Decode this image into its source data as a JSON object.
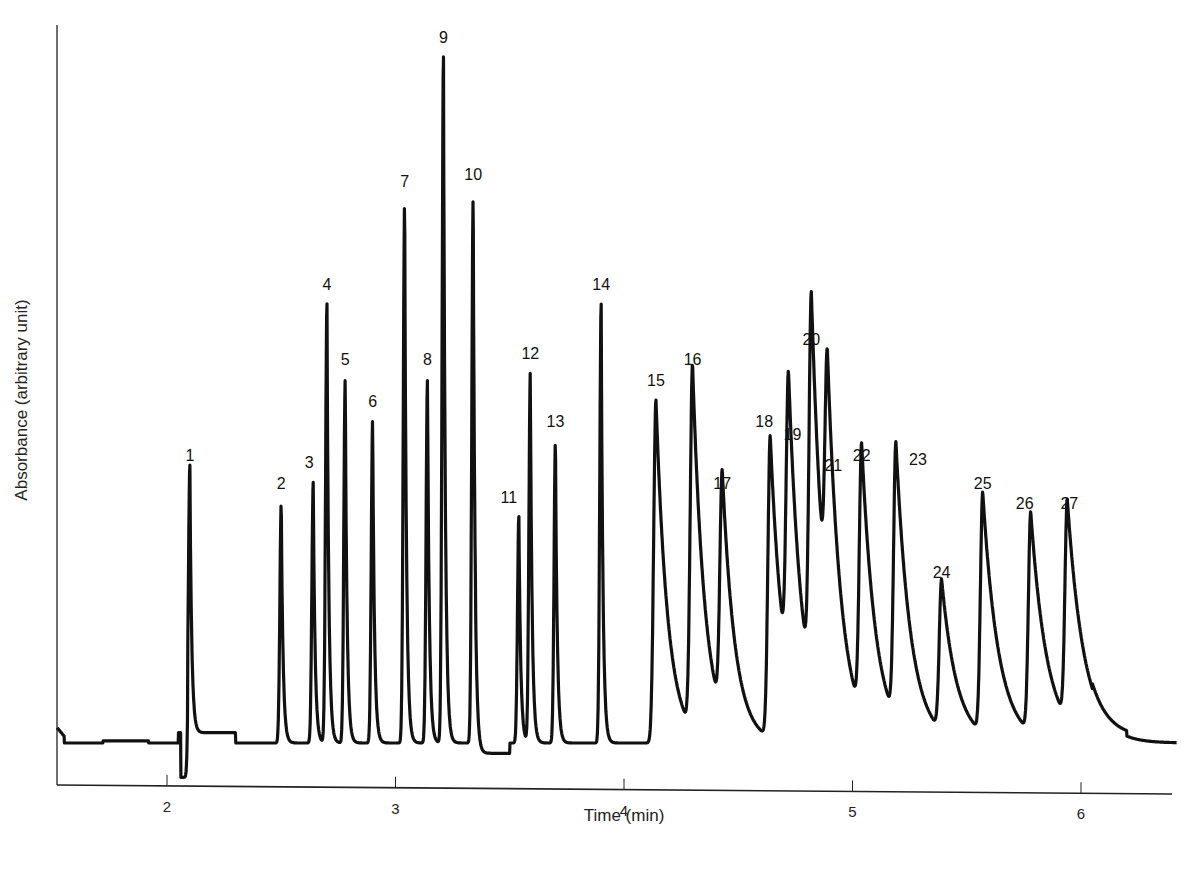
{
  "chart_data": {
    "type": "line",
    "title": "",
    "xlabel": "Time (min)",
    "ylabel": "Absorbance (arbitrary unit)",
    "xlim": [
      1.5,
      6.4
    ],
    "ylim": [
      0,
      100
    ],
    "xticks": [
      2,
      3,
      4,
      5,
      6
    ],
    "yticks": [],
    "grid": false,
    "legend": null,
    "peaks": [
      {
        "label": "1",
        "time": 2.1,
        "height": 39
      },
      {
        "label": "2",
        "time": 2.5,
        "height": 35
      },
      {
        "label": "3",
        "time": 2.64,
        "height": 38
      },
      {
        "label": "4",
        "time": 2.7,
        "height": 64
      },
      {
        "label": "5",
        "time": 2.78,
        "height": 53
      },
      {
        "label": "6",
        "time": 2.9,
        "height": 47
      },
      {
        "label": "7",
        "time": 3.04,
        "height": 79
      },
      {
        "label": "8",
        "time": 3.14,
        "height": 53
      },
      {
        "label": "9",
        "time": 3.21,
        "height": 100
      },
      {
        "label": "10",
        "time": 3.34,
        "height": 80
      },
      {
        "label": "11",
        "time": 3.54,
        "height": 33
      },
      {
        "label": "12",
        "time": 3.59,
        "height": 54
      },
      {
        "label": "13",
        "time": 3.7,
        "height": 44
      },
      {
        "label": "14",
        "time": 3.9,
        "height": 64
      },
      {
        "label": "15",
        "time": 4.14,
        "height": 50
      },
      {
        "label": "16",
        "time": 4.3,
        "height": 53
      },
      {
        "label": "17",
        "time": 4.43,
        "height": 35
      },
      {
        "label": "18",
        "time": 4.64,
        "height": 44
      },
      {
        "label": "19",
        "time": 4.72,
        "height": 43
      },
      {
        "label": "20",
        "time": 4.82,
        "height": 56
      },
      {
        "label": "21",
        "time": 4.89,
        "height": 37
      },
      {
        "label": "22",
        "time": 5.04,
        "height": 39
      },
      {
        "label": "23",
        "time": 5.19,
        "height": 40
      },
      {
        "label": "24",
        "time": 5.39,
        "height": 22
      },
      {
        "label": "25",
        "time": 5.57,
        "height": 35
      },
      {
        "label": "26",
        "time": 5.78,
        "height": 32
      },
      {
        "label": "27",
        "time": 5.94,
        "height": 32
      }
    ]
  }
}
